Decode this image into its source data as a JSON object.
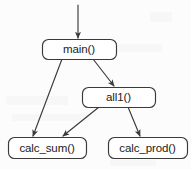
{
  "diagram": {
    "type": "call-graph",
    "title": "",
    "background_color": "#fcfcfc",
    "stroke_color": "#3a3a3a",
    "node_fill": "#ffffff",
    "text_color": "#1a1a1a",
    "nodes": [
      {
        "id": "main",
        "label": "main()",
        "x": 42,
        "y": 39,
        "width": 74,
        "height": 20,
        "font_size": 11.5
      },
      {
        "id": "all1",
        "label": "all1()",
        "x": 82,
        "y": 87,
        "width": 73,
        "height": 20,
        "font_size": 11.5
      },
      {
        "id": "calc_sum",
        "label": "calc_sum()",
        "x": 8,
        "y": 137,
        "width": 78,
        "height": 21,
        "font_size": 11.5
      },
      {
        "id": "calc_prod",
        "label": "calc_prod()",
        "x": 108,
        "y": 137,
        "width": 79,
        "height": 21,
        "font_size": 11.5
      }
    ],
    "edges": [
      {
        "id": "entry-to-main",
        "from": "",
        "to": "main",
        "x1": 78,
        "y1": 5,
        "x2": 78,
        "y2": 38
      },
      {
        "id": "main-to-calc_sum",
        "from": "main",
        "to": "calc_sum",
        "x1": 62,
        "y1": 59,
        "x2": 33,
        "y2": 136
      },
      {
        "id": "main-to-all1",
        "from": "main",
        "to": "all1",
        "x1": 93,
        "y1": 59,
        "x2": 114,
        "y2": 86
      },
      {
        "id": "all1-to-calc_sum",
        "from": "all1",
        "to": "calc_sum",
        "x1": 99,
        "y1": 107,
        "x2": 63,
        "y2": 136
      },
      {
        "id": "all1-to-calc_prod",
        "from": "all1",
        "to": "calc_prod",
        "x1": 128,
        "y1": 107,
        "x2": 140,
        "y2": 136
      }
    ]
  }
}
